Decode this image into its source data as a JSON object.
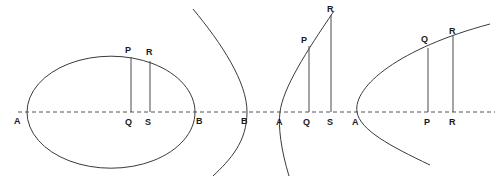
{
  "figure": {
    "canvas": {
      "width": 501,
      "height": 181
    },
    "colors": {
      "background": "#ffffff",
      "curve": "#3a3a3a",
      "ordinate": "#4a4a4a",
      "axis": "#555555",
      "label": "#1a1a1a"
    },
    "axis": {
      "name": "principal-axis",
      "style": "dashed",
      "y": 112,
      "x_start": 18,
      "x_end": 495,
      "dash_pattern": "4 3"
    },
    "panels": [
      {
        "id": "ellipse-panel",
        "type": "ellipse",
        "curve_path": "M 27 112 A 84 56 0 1 1 27 112.4 Z",
        "points": [
          {
            "name": "A",
            "label": "A",
            "x": 27,
            "y": 112,
            "label_x": 14,
            "label_y": 124
          },
          {
            "name": "B",
            "label": "B",
            "x": 195,
            "y": 112,
            "label_x": 196,
            "label_y": 124
          },
          {
            "name": "P",
            "label": "P",
            "x": 131,
            "y": 57,
            "label_x": 125,
            "label_y": 53
          },
          {
            "name": "Q",
            "label": "Q",
            "x": 131,
            "y": 112,
            "label_x": 125,
            "label_y": 125
          },
          {
            "name": "R",
            "label": "R",
            "x": 150,
            "y": 61,
            "label_x": 146,
            "label_y": 55
          },
          {
            "name": "S",
            "label": "S",
            "x": 150,
            "y": 112,
            "label_x": 145,
            "label_y": 125
          }
        ],
        "ordinates": [
          {
            "name": "ordinate-PQ",
            "x1": 131,
            "y1": 57,
            "x2": 131,
            "y2": 112
          },
          {
            "name": "ordinate-RS",
            "x1": 150,
            "y1": 61,
            "x2": 150,
            "y2": 112
          }
        ]
      },
      {
        "id": "hyperbola-panel",
        "type": "hyperbola-branch",
        "curve_path": "M 193 9 C 222 44 247 82 247 112 C 247 142 230 160 213 176",
        "points": [
          {
            "name": "B",
            "label": "B",
            "x": 247,
            "y": 112,
            "label_x": 241,
            "label_y": 124
          }
        ],
        "ordinates": []
      },
      {
        "id": "parabola-panel-1",
        "type": "parabola",
        "curve_path": "M 289 176 C 281 150 278 126 280 112 C 283 88 306 52 334 11",
        "points": [
          {
            "name": "A",
            "label": "A",
            "x": 280,
            "y": 112,
            "label_x": 276,
            "label_y": 125
          },
          {
            "name": "Q",
            "label": "Q",
            "x": 309,
            "y": 112,
            "label_x": 303,
            "label_y": 125
          },
          {
            "name": "P",
            "label": "P",
            "x": 309,
            "y": 46,
            "label_x": 301,
            "label_y": 43
          },
          {
            "name": "S",
            "label": "S",
            "x": 331,
            "y": 112,
            "label_x": 327,
            "label_y": 125
          },
          {
            "name": "R",
            "label": "R",
            "x": 331,
            "y": 15,
            "label_x": 327,
            "label_y": 12
          }
        ],
        "ordinates": [
          {
            "name": "ordinate-PQ",
            "x1": 309,
            "y1": 46,
            "x2": 309,
            "y2": 112
          },
          {
            "name": "ordinate-RS",
            "x1": 331,
            "y1": 15,
            "x2": 331,
            "y2": 112
          }
        ]
      },
      {
        "id": "parabola-panel-2",
        "type": "parabola",
        "curve_path": "M 430 165 C 390 146 360 130 357 112 C 353 86 400 48 490 24",
        "points": [
          {
            "name": "A",
            "label": "A",
            "x": 357,
            "y": 112,
            "label_x": 352,
            "label_y": 125
          },
          {
            "name": "P",
            "label": "P",
            "x": 428,
            "y": 112,
            "label_x": 424,
            "label_y": 125
          },
          {
            "name": "Q",
            "label": "Q",
            "x": 428,
            "y": 48,
            "label_x": 421,
            "label_y": 42
          },
          {
            "name": "R",
            "label": "R",
            "x": 453,
            "y": 112,
            "label_x": 449,
            "label_y": 125
          },
          {
            "name": "R2",
            "label": "R",
            "x": 453,
            "y": 36,
            "label_x": 449,
            "label_y": 34
          }
        ],
        "ordinates": [
          {
            "name": "ordinate-QP",
            "x1": 428,
            "y1": 48,
            "x2": 428,
            "y2": 112
          },
          {
            "name": "ordinate-RR",
            "x1": 453,
            "y1": 36,
            "x2": 453,
            "y2": 112
          }
        ]
      }
    ]
  }
}
